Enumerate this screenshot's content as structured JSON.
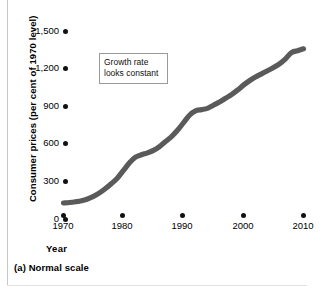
{
  "figure": {
    "caption": "(a) Normal scale",
    "x_axis_title": "Year",
    "y_axis_title": "Consumer prices (per cent of 1970 level)"
  },
  "annotation": {
    "line1": "Growth rate",
    "line2": "looks constant"
  },
  "colors": {
    "line": "#5a5a5a",
    "dot": "#111111",
    "annotation_border": "#9a9a9a",
    "background": "#ffffff",
    "rule": "#c9c9c9"
  },
  "chart_data": {
    "type": "line",
    "title": "",
    "subtitle": "",
    "xlabel": "Year",
    "ylabel": "Consumer prices (per cent of 1970 level)",
    "xlim": [
      1970,
      2010
    ],
    "ylim": [
      0,
      1500
    ],
    "grid": false,
    "legend": null,
    "y_ticks": [
      0,
      300,
      600,
      900,
      1200,
      1500
    ],
    "y_tick_labels": [
      "0",
      "300",
      "600",
      "900",
      "1,200",
      "1,500"
    ],
    "x_ticks": [
      1970,
      1980,
      1990,
      2000,
      2010
    ],
    "x_tick_labels": [
      "1970",
      "1980",
      "1990",
      "2000",
      "2010"
    ],
    "annotations": [
      {
        "text": "Growth rate looks constant",
        "x": 1980,
        "y": 1290,
        "boxed": true
      }
    ],
    "series": [
      {
        "name": "Consumer prices",
        "color": "#5a5a5a",
        "x": [
          1970,
          1971,
          1972,
          1973,
          1974,
          1975,
          1976,
          1977,
          1978,
          1979,
          1980,
          1981,
          1982,
          1983,
          1984,
          1985,
          1986,
          1987,
          1988,
          1989,
          1990,
          1991,
          1992,
          1993,
          1994,
          1995,
          1996,
          1997,
          1998,
          1999,
          2000,
          2001,
          2002,
          2003,
          2004,
          2005,
          2006,
          2007,
          2008,
          2009,
          2010
        ],
        "values": [
          100,
          104,
          110,
          118,
          132,
          152,
          180,
          215,
          255,
          300,
          360,
          420,
          465,
          485,
          500,
          520,
          550,
          590,
          630,
          680,
          740,
          800,
          835,
          845,
          855,
          880,
          905,
          935,
          965,
          1000,
          1040,
          1075,
          1105,
          1130,
          1155,
          1180,
          1210,
          1250,
          1300,
          1315,
          1330
        ]
      }
    ]
  }
}
